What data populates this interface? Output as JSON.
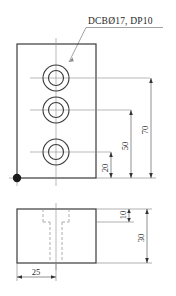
{
  "drawing": {
    "type": "mechanical-orthographic-drawing",
    "units": "mm",
    "annotation": {
      "hole_callout": "DCBØ17, DP10"
    },
    "front_view": {
      "name": "front-view",
      "holes": [
        {
          "id": "hole-top",
          "label": "counterbored hole 1"
        },
        {
          "id": "hole-middle",
          "label": "counterbored hole 2"
        },
        {
          "id": "hole-bottom",
          "label": "counterbored hole 3"
        }
      ],
      "dimensions": [
        {
          "id": "dim-20",
          "value": "20",
          "orientation": "vertical"
        },
        {
          "id": "dim-50",
          "value": "50",
          "orientation": "vertical"
        },
        {
          "id": "dim-70",
          "value": "70",
          "orientation": "vertical"
        }
      ],
      "datum_marker": "origin-datum-point"
    },
    "side_view": {
      "name": "side-view",
      "dimensions": [
        {
          "id": "dim-10",
          "value": "10",
          "orientation": "vertical"
        },
        {
          "id": "dim-30",
          "value": "30",
          "orientation": "vertical"
        },
        {
          "id": "dim-25",
          "value": "25",
          "orientation": "horizontal"
        }
      ]
    },
    "colors": {
      "outline": "#3a3a3a",
      "centerline": "#8c8c8c",
      "hidden": "#9a9a9a",
      "dimension": "#555555",
      "text": "#1f1f1f",
      "background": "#ffffff"
    }
  }
}
